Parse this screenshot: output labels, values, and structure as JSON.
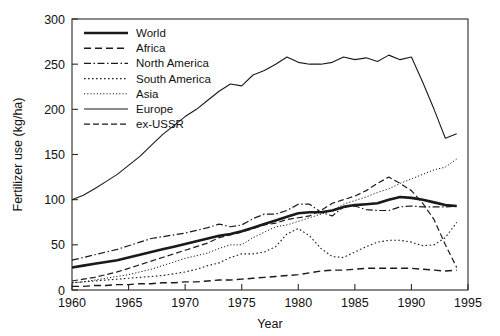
{
  "chart_data": {
    "type": "line",
    "title": "",
    "xlabel": "Year",
    "ylabel": "Fertilizer use (kg/ha)",
    "xlim": [
      1960,
      1995
    ],
    "ylim": [
      0,
      300
    ],
    "xticks": [
      1960,
      1965,
      1970,
      1975,
      1980,
      1985,
      1990,
      1995
    ],
    "yticks": [
      0,
      50,
      100,
      150,
      200,
      250,
      300
    ],
    "grid": false,
    "legend_position": "top-left",
    "x": [
      1960,
      1961,
      1962,
      1963,
      1964,
      1965,
      1966,
      1967,
      1968,
      1969,
      1970,
      1971,
      1972,
      1973,
      1974,
      1975,
      1976,
      1977,
      1978,
      1979,
      1980,
      1981,
      1982,
      1983,
      1984,
      1985,
      1986,
      1987,
      1988,
      1989,
      1990,
      1991,
      1992,
      1993,
      1994
    ],
    "series": [
      {
        "name": "World",
        "style": "solid-thick",
        "values": [
          25,
          27,
          29,
          31,
          33,
          36,
          39,
          42,
          45,
          48,
          51,
          54,
          57,
          60,
          62,
          65,
          69,
          73,
          77,
          81,
          85,
          86,
          86,
          88,
          92,
          94,
          95,
          96,
          100,
          103,
          102,
          100,
          97,
          94,
          93
        ]
      },
      {
        "name": "Africa",
        "style": "dashed",
        "values": [
          4,
          4,
          5,
          5,
          6,
          6,
          7,
          7,
          8,
          8,
          9,
          9,
          10,
          11,
          11,
          12,
          13,
          14,
          15,
          16,
          17,
          19,
          21,
          22,
          22,
          23,
          24,
          24,
          24,
          24,
          24,
          23,
          22,
          21,
          22
        ]
      },
      {
        "name": "North America",
        "style": "dash-dot",
        "values": [
          33,
          36,
          39,
          42,
          45,
          49,
          53,
          57,
          59,
          61,
          63,
          66,
          69,
          73,
          70,
          72,
          79,
          84,
          84,
          88,
          95,
          95,
          86,
          82,
          92,
          93,
          89,
          88,
          88,
          92,
          93,
          92,
          92,
          92,
          93
        ]
      },
      {
        "name": "South America",
        "style": "dotted",
        "values": [
          8,
          9,
          10,
          11,
          12,
          13,
          14,
          15,
          16,
          18,
          20,
          23,
          27,
          30,
          36,
          40,
          40,
          42,
          48,
          62,
          68,
          60,
          46,
          37,
          36,
          42,
          48,
          53,
          55,
          55,
          53,
          49,
          50,
          58,
          75
        ]
      },
      {
        "name": "Asia",
        "style": "dotted-fine",
        "values": [
          8,
          9,
          11,
          13,
          15,
          17,
          20,
          23,
          27,
          31,
          35,
          38,
          41,
          46,
          50,
          50,
          58,
          64,
          70,
          72,
          76,
          80,
          84,
          88,
          95,
          99,
          103,
          108,
          112,
          118,
          123,
          128,
          133,
          136,
          145
        ]
      },
      {
        "name": "Europe",
        "style": "solid-thin",
        "values": [
          100,
          105,
          112,
          120,
          128,
          138,
          148,
          160,
          172,
          182,
          192,
          200,
          210,
          220,
          228,
          226,
          238,
          243,
          250,
          258,
          252,
          250,
          250,
          252,
          258,
          255,
          257,
          253,
          260,
          255,
          258,
          230,
          200,
          168,
          173
        ]
      },
      {
        "name": "ex-USSR",
        "style": "dashed-long",
        "values": [
          10,
          12,
          14,
          17,
          20,
          24,
          28,
          32,
          36,
          40,
          44,
          48,
          52,
          58,
          61,
          64,
          68,
          72,
          74,
          78,
          80,
          82,
          88,
          96,
          100,
          104,
          110,
          118,
          125,
          118,
          110,
          96,
          78,
          50,
          25
        ]
      }
    ]
  },
  "legend": {
    "entries": [
      {
        "label": "World"
      },
      {
        "label": "Africa"
      },
      {
        "label": "North America"
      },
      {
        "label": "South America"
      },
      {
        "label": "Asia"
      },
      {
        "label": "Europe"
      },
      {
        "label": "ex-USSR"
      }
    ]
  }
}
